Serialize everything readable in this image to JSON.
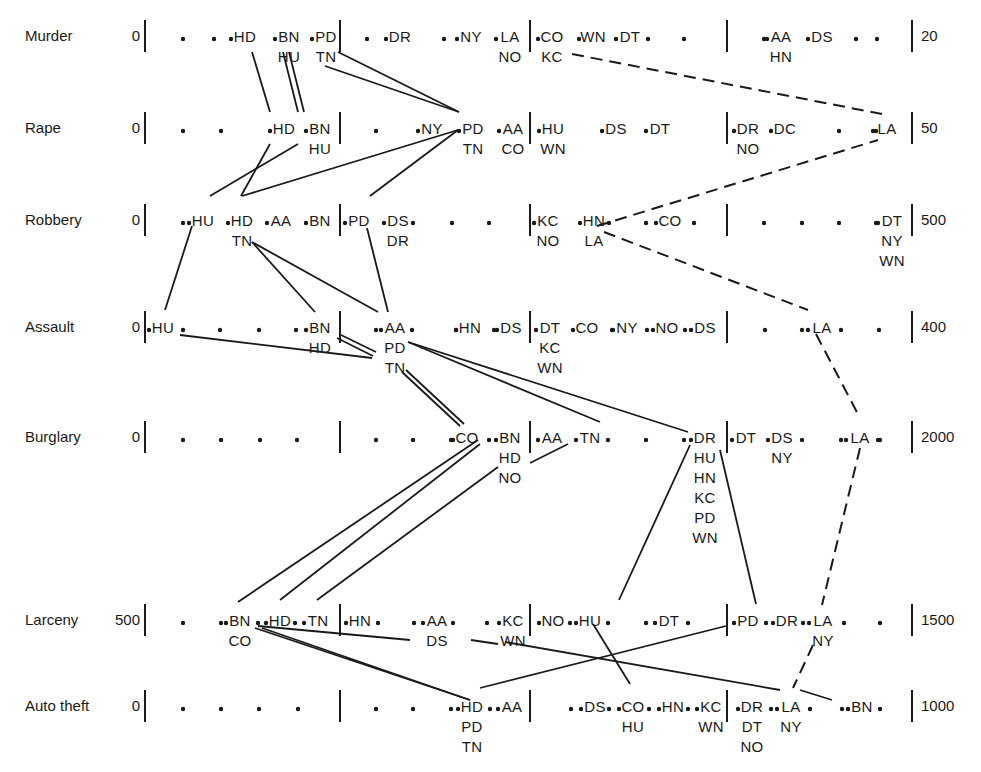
{
  "chart_data": {
    "type": "parallel-dot-scale",
    "title": "",
    "rows": [
      {
        "name": "Murder",
        "min_label": "0",
        "max_label": "20",
        "y": 36,
        "items": [
          {
            "x": 245,
            "stack": [
              "HD"
            ]
          },
          {
            "x": 289,
            "stack": [
              "BN",
              "HU"
            ]
          },
          {
            "x": 326,
            "stack": [
              "PD",
              "TN"
            ]
          },
          {
            "x": 400,
            "stack": [
              "DR"
            ]
          },
          {
            "x": 471,
            "stack": [
              "NY"
            ]
          },
          {
            "x": 510,
            "stack": [
              "LA",
              "NO"
            ]
          },
          {
            "x": 552,
            "stack": [
              "CO",
              "KC"
            ]
          },
          {
            "x": 593,
            "stack": [
              "WN"
            ]
          },
          {
            "x": 630,
            "stack": [
              "DT"
            ]
          },
          {
            "x": 781,
            "stack": [
              "AA",
              "HN"
            ]
          },
          {
            "x": 822,
            "stack": [
              "DS"
            ]
          }
        ],
        "dots": [
          183,
          214,
          367,
          444,
          648,
          684,
          764,
          856,
          877
        ]
      },
      {
        "name": "Rape",
        "min_label": "0",
        "max_label": "50",
        "y": 128,
        "items": [
          {
            "x": 284,
            "stack": [
              "HD"
            ]
          },
          {
            "x": 320,
            "stack": [
              "BN",
              "HU"
            ]
          },
          {
            "x": 432,
            "stack": [
              "NY"
            ]
          },
          {
            "x": 473,
            "stack": [
              "PD",
              "TN"
            ]
          },
          {
            "x": 513,
            "stack": [
              "AA",
              "CO"
            ]
          },
          {
            "x": 553,
            "stack": [
              "HU",
              "WN"
            ]
          },
          {
            "x": 616,
            "stack": [
              "DS"
            ]
          },
          {
            "x": 660,
            "stack": [
              "DT"
            ]
          },
          {
            "x": 748,
            "stack": [
              "DR",
              "NO"
            ]
          },
          {
            "x": 785,
            "stack": [
              "DC"
            ]
          },
          {
            "x": 887,
            "stack": [
              "LA"
            ]
          }
        ],
        "dots": [
          183,
          221,
          376,
          839,
          876
        ]
      },
      {
        "name": "Robbery",
        "min_label": "0",
        "max_label": "500",
        "y": 220,
        "items": [
          {
            "x": 203,
            "stack": [
              "HU"
            ]
          },
          {
            "x": 242,
            "stack": [
              "HD",
              "TN"
            ]
          },
          {
            "x": 281,
            "stack": [
              "AA"
            ]
          },
          {
            "x": 320,
            "stack": [
              "BN"
            ]
          },
          {
            "x": 359,
            "stack": [
              "PD"
            ]
          },
          {
            "x": 398,
            "stack": [
              "DS",
              "DR"
            ]
          },
          {
            "x": 548,
            "stack": [
              "KC",
              "NO"
            ]
          },
          {
            "x": 594,
            "stack": [
              "HN",
              "LA"
            ]
          },
          {
            "x": 670,
            "stack": [
              "CO"
            ]
          },
          {
            "x": 892,
            "stack": [
              "DT",
              "NY",
              "WN"
            ]
          }
        ],
        "dots": [
          183,
          413,
          452,
          489,
          609,
          646,
          694,
          764,
          802,
          839,
          876
        ]
      },
      {
        "name": "Assault",
        "min_label": "0",
        "max_label": "400",
        "y": 327,
        "items": [
          {
            "x": 163,
            "stack": [
              "HU"
            ]
          },
          {
            "x": 320,
            "stack": [
              "BN",
              "HD"
            ]
          },
          {
            "x": 395,
            "stack": [
              "AA",
              "PD",
              "TN"
            ]
          },
          {
            "x": 470,
            "stack": [
              "HN"
            ]
          },
          {
            "x": 511,
            "stack": [
              "DS"
            ]
          },
          {
            "x": 550,
            "stack": [
              "DT",
              "KC",
              "WN"
            ]
          },
          {
            "x": 587,
            "stack": [
              "CO"
            ]
          },
          {
            "x": 627,
            "stack": [
              "NY"
            ]
          },
          {
            "x": 667,
            "stack": [
              "NO"
            ]
          },
          {
            "x": 705,
            "stack": [
              "DS"
            ]
          },
          {
            "x": 822,
            "stack": [
              "LA"
            ]
          }
        ],
        "dots": [
          183,
          220,
          259,
          296,
          376,
          412,
          456,
          494,
          612,
          647,
          685,
          765,
          802,
          841,
          879
        ]
      },
      {
        "name": "Burglary",
        "min_label": "0",
        "max_label": "2000",
        "y": 437,
        "items": [
          {
            "x": 467,
            "stack": [
              "CO"
            ]
          },
          {
            "x": 510,
            "stack": [
              "BN",
              "HD",
              "NO"
            ]
          },
          {
            "x": 552,
            "stack": [
              "AA"
            ]
          },
          {
            "x": 590,
            "stack": [
              "TN"
            ]
          },
          {
            "x": 705,
            "stack": [
              "DR",
              "HU",
              "HN",
              "KC",
              "PD",
              "WN"
            ]
          },
          {
            "x": 746,
            "stack": [
              "DT"
            ]
          },
          {
            "x": 782,
            "stack": [
              "DS",
              "NY"
            ]
          },
          {
            "x": 860,
            "stack": [
              "LA"
            ]
          }
        ],
        "dots": [
          183,
          221,
          260,
          297,
          376,
          413,
          451,
          489,
          608,
          646,
          684,
          802,
          841,
          880,
          878
        ]
      },
      {
        "name": "Larceny",
        "min_label": "500",
        "max_label": "1500",
        "y": 620,
        "items": [
          {
            "x": 240,
            "stack": [
              "BN",
              "CO"
            ]
          },
          {
            "x": 280,
            "stack": [
              "HD"
            ]
          },
          {
            "x": 318,
            "stack": [
              "TN"
            ]
          },
          {
            "x": 360,
            "stack": [
              "HN"
            ]
          },
          {
            "x": 437,
            "stack": [
              "AA",
              "DS"
            ]
          },
          {
            "x": 513,
            "stack": [
              "KC",
              "WN"
            ]
          },
          {
            "x": 553,
            "stack": [
              "NO"
            ]
          },
          {
            "x": 590,
            "stack": [
              "HU"
            ]
          },
          {
            "x": 669,
            "stack": [
              "DT"
            ]
          },
          {
            "x": 748,
            "stack": [
              "PD"
            ]
          },
          {
            "x": 787,
            "stack": [
              "DR"
            ]
          },
          {
            "x": 823,
            "stack": [
              "LA",
              "NY"
            ]
          }
        ],
        "dots": [
          183,
          221,
          258,
          295,
          378,
          414,
          453,
          487,
          570,
          608,
          646,
          688,
          766,
          803,
          844,
          880
        ]
      },
      {
        "name": "Auto theft",
        "min_label": "0",
        "max_label": "1000",
        "y": 706,
        "items": [
          {
            "x": 472,
            "stack": [
              "HD",
              "PD",
              "TN"
            ]
          },
          {
            "x": 512,
            "stack": [
              "AA"
            ]
          },
          {
            "x": 595,
            "stack": [
              "DS"
            ]
          },
          {
            "x": 633,
            "stack": [
              "CO",
              "HU"
            ]
          },
          {
            "x": 673,
            "stack": [
              "HN"
            ]
          },
          {
            "x": 711,
            "stack": [
              "KC",
              "WN"
            ]
          },
          {
            "x": 752,
            "stack": [
              "DR",
              "DT",
              "NO"
            ]
          },
          {
            "x": 791,
            "stack": [
              "LA",
              "NY"
            ]
          },
          {
            "x": 862,
            "stack": [
              "BN"
            ]
          }
        ],
        "dots": [
          183,
          221,
          259,
          298,
          376,
          413,
          451,
          490,
          571,
          609,
          649,
          688,
          771,
          810,
          842,
          880
        ]
      }
    ],
    "axis_bars_x": [
      145,
      340,
      530,
      727,
      912
    ],
    "connections_solid": [
      [
        [
          252,
          52
        ],
        [
          270,
          112
        ]
      ],
      [
        [
          283,
          52
        ],
        [
          298,
          112
        ]
      ],
      [
        [
          289,
          52
        ],
        [
          304,
          112
        ]
      ],
      [
        [
          338,
          52
        ],
        [
          459,
          112
        ]
      ],
      [
        [
          325,
          66
        ],
        [
          459,
          112
        ]
      ],
      [
        [
          270,
          144
        ],
        [
          241,
          196
        ]
      ],
      [
        [
          298,
          144
        ],
        [
          210,
          196
        ]
      ],
      [
        [
          458,
          130
        ],
        [
          242,
          196
        ]
      ],
      [
        [
          458,
          130
        ],
        [
          370,
          196
        ]
      ],
      [
        [
          192,
          226
        ],
        [
          165,
          310
        ]
      ],
      [
        [
          252,
          242
        ],
        [
          315,
          312
        ]
      ],
      [
        [
          252,
          242
        ],
        [
          378,
          312
        ]
      ],
      [
        [
          367,
          228
        ],
        [
          388,
          312
        ]
      ],
      [
        [
          180,
          335
        ],
        [
          372,
          358
        ]
      ],
      [
        [
          337,
          338
        ],
        [
          373,
          356
        ]
      ],
      [
        [
          341,
          335
        ],
        [
          376,
          352
        ]
      ],
      [
        [
          408,
          342
        ],
        [
          688,
          432
        ]
      ],
      [
        [
          408,
          342
        ],
        [
          600,
          422
        ]
      ],
      [
        [
          402,
          372
        ],
        [
          460,
          426
        ]
      ],
      [
        [
          406,
          370
        ],
        [
          464,
          424
        ]
      ],
      [
        [
          478,
          440
        ],
        [
          238,
          602
        ]
      ],
      [
        [
          480,
          444
        ],
        [
          280,
          600
        ]
      ],
      [
        [
          498,
          467
        ],
        [
          317,
          600
        ]
      ],
      [
        [
          568,
          444
        ],
        [
          530,
          463
        ]
      ],
      [
        [
          690,
          445
        ],
        [
          619,
          600
        ]
      ],
      [
        [
          720,
          450
        ],
        [
          756,
          604
        ]
      ],
      [
        [
          262,
          628
        ],
        [
          470,
          700
        ]
      ],
      [
        [
          255,
          628
        ],
        [
          470,
          700
        ]
      ],
      [
        [
          258,
          626
        ],
        [
          410,
          640
        ]
      ],
      [
        [
          471,
          640
        ],
        [
          498,
          644
        ]
      ],
      [
        [
          505,
          642
        ],
        [
          780,
          690
        ]
      ],
      [
        [
          593,
          624
        ],
        [
          630,
          684
        ]
      ],
      [
        [
          480,
          688
        ],
        [
          726,
          626
        ]
      ],
      [
        [
          800,
          690
        ],
        [
          832,
          700
        ]
      ]
    ],
    "connections_dashed": [
      [
        [
          572,
          54
        ],
        [
          882,
          114
        ]
      ],
      [
        [
          597,
          226
        ],
        [
          878,
          140
        ]
      ],
      [
        [
          604,
          232
        ],
        [
          808,
          310
        ]
      ],
      [
        [
          816,
          334
        ],
        [
          860,
          418
        ]
      ],
      [
        [
          860,
          448
        ],
        [
          822,
          605
        ]
      ],
      [
        [
          813,
          645
        ],
        [
          793,
          688
        ]
      ]
    ]
  }
}
